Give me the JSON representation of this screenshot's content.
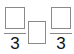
{
  "expression": {
    "left_fraction": {
      "numerator": "",
      "denominator": "3"
    },
    "comparison": "",
    "right_fraction": {
      "numerator": "",
      "denominator": "3"
    }
  },
  "colors": {
    "box_border": "#8a8a8a",
    "text": "#111111"
  }
}
